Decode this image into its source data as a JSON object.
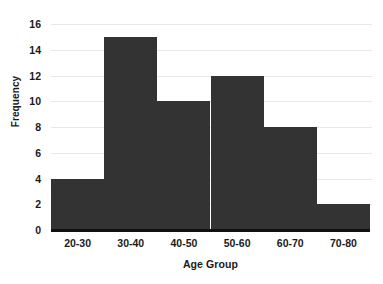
{
  "chart_data": {
    "type": "bar",
    "title": "",
    "subtitle": "",
    "xlabel": "Age Group",
    "ylabel": "Frequency",
    "categories": [
      "20-30",
      "30-40",
      "40-50",
      "50-60",
      "60-70",
      "70-80"
    ],
    "values": [
      4,
      15,
      10,
      12,
      8,
      2
    ],
    "series": [
      {
        "name": "Frequency",
        "values": [
          4,
          15,
          10,
          12,
          8,
          2
        ]
      }
    ],
    "ylim": [
      0,
      16
    ],
    "xlim_categories": 6,
    "y_ticks": [
      0,
      2,
      4,
      6,
      8,
      10,
      12,
      14,
      16
    ],
    "y_tick_labels": [
      "0",
      "2",
      "4",
      "6",
      "8",
      "10",
      "12",
      "14",
      "16"
    ],
    "x_tick_labels": [
      "20-30",
      "30-40",
      "40-50",
      "50-60",
      "60-70",
      "70-80"
    ],
    "grid": true,
    "grid_axis": "y",
    "legend": false,
    "legend_position": "none",
    "bar_gap": 0,
    "annotations": [],
    "colors": {
      "bar": "#333333",
      "gridline": "#e8e8e8",
      "axis": "#111111",
      "text": "#1a1a1a",
      "background": "#ffffff"
    }
  }
}
